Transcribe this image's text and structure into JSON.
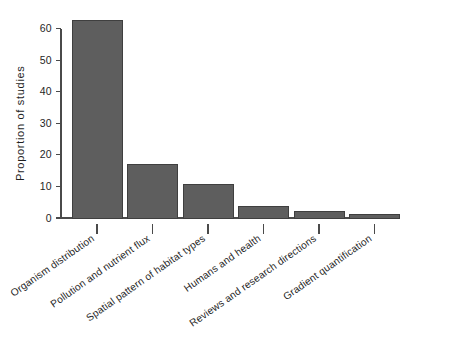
{
  "chart_data": {
    "type": "bar",
    "title": "",
    "xlabel": "",
    "ylabel": "Proportion of studies",
    "ylim": [
      0,
      63
    ],
    "yticks": [
      0,
      10,
      20,
      30,
      40,
      50,
      60
    ],
    "ytick_labels": [
      "0",
      "10",
      "20",
      "30",
      "40",
      "50",
      "60"
    ],
    "grid": false,
    "legend": "none",
    "bar_fill_color": "#5e5e5e",
    "bar_border_color": "#3f3f3f",
    "axis_color": "#4a4a4a",
    "background_color": "#ffffff",
    "categories": [
      "Organism distribution",
      "Pollution and nutrient flux",
      "Spatial pattern of habitat types",
      "Humans and health",
      "Reviews and research directions",
      "Gradient quantification"
    ],
    "values": [
      62.5,
      16.8,
      10.5,
      3.5,
      2.2,
      1.2
    ],
    "category_label_rotation_degrees": -35
  }
}
